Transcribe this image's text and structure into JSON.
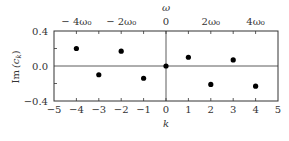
{
  "chart_data": {
    "type": "scatter",
    "title": "",
    "xlabel": "k",
    "ylabel": "Im (c_k)",
    "top_xlabel": "ω",
    "xlim": [
      -5,
      5
    ],
    "ylim": [
      -0.4,
      0.4
    ],
    "grid": false,
    "legend": null,
    "x_ticks": [
      -5,
      -4,
      -3,
      -2,
      -1,
      0,
      1,
      2,
      3,
      4,
      5
    ],
    "x_tick_labels": [
      "−5",
      "−4",
      "−3",
      "−2",
      "−1",
      "0",
      "1",
      "2",
      "3",
      "4",
      "5"
    ],
    "y_ticks": [
      -0.4,
      0.0,
      0.4
    ],
    "y_tick_labels": [
      "−0.4",
      "0.0",
      "0.4"
    ],
    "top_ticks": [
      -4,
      -2,
      0,
      2,
      4
    ],
    "top_tick_labels": [
      "− 4ω₀",
      "− 2ω₀",
      "0",
      "2ω₀",
      "4ω₀"
    ],
    "series": [
      {
        "name": "Im(c_k)",
        "x": [
          -4,
          -3,
          -2,
          -1,
          0,
          1,
          2,
          3,
          4
        ],
        "values": [
          0.2,
          -0.1,
          0.17,
          -0.14,
          0.0,
          0.1,
          -0.21,
          0.07,
          -0.23
        ]
      }
    ],
    "annotations": [
      "vertical line at k=0",
      "horizontal line at y=0"
    ]
  },
  "labels": {
    "xlabel": "k",
    "ylabel_main": "Im",
    "ylabel_sym": "(c",
    "ylabel_sub": "k",
    "ylabel_close": ")",
    "top_label": "ω"
  }
}
